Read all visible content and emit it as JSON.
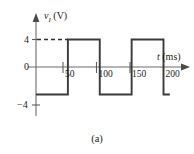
{
  "figure": {
    "caption": "(a)",
    "y_axis_label_var": "v",
    "y_axis_label_sub": "I",
    "y_axis_label_unit": "(V)",
    "x_axis_label_var": "t",
    "x_axis_label_unit": "(ms)",
    "colors": {
      "signal": "#3a3a3a",
      "axis": "#6d6d6d",
      "text": "#1c1c1c",
      "background": "#ffffff"
    }
  },
  "chart_data": {
    "type": "line",
    "title": "",
    "subtitle": "",
    "xlabel": "t (ms)",
    "ylabel": "v_I (V)",
    "xlim": [
      0,
      210
    ],
    "ylim": [
      -6,
      6
    ],
    "grid": false,
    "legend": null,
    "x_ticks": [
      50,
      100,
      150,
      200
    ],
    "x_tick_labels": [
      "50",
      "100",
      "150",
      "200"
    ],
    "y_ticks": [
      4,
      0,
      -4
    ],
    "y_tick_labels": [
      "4",
      "0",
      "−4"
    ],
    "waveform_description": "Square wave, amplitude 4 V, period 100 ms, starting at -4 V",
    "amplitude": 4,
    "period_ms": 100,
    "series": [
      {
        "name": "v_I",
        "x": [
          0,
          50,
          50,
          100,
          100,
          150,
          150,
          200,
          200,
          210
        ],
        "y": [
          -4,
          -4,
          4,
          4,
          -4,
          -4,
          4,
          4,
          -4,
          -4
        ]
      }
    ],
    "annotations": [
      {
        "type": "dashed-guide",
        "value": 4,
        "from_x": 0,
        "to_x": 50,
        "note": "dashed horizontal line from y-axis to the rising edge at t=50 indicating the +4 V level"
      }
    ]
  }
}
